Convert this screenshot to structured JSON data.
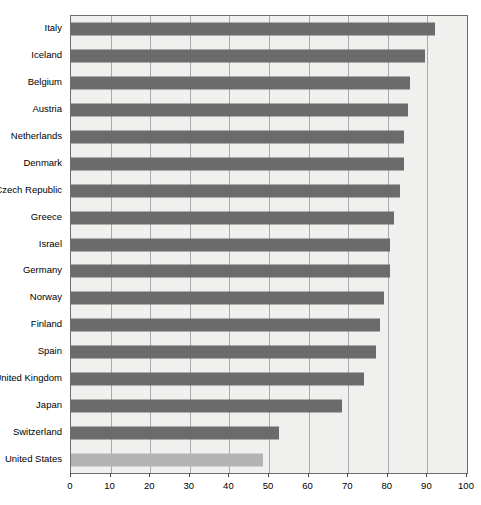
{
  "chart_data": {
    "type": "bar",
    "orientation": "horizontal",
    "title": "",
    "xlabel": "",
    "ylabel": "",
    "xlim": [
      0,
      100
    ],
    "xticks": [
      0,
      10,
      20,
      30,
      40,
      50,
      60,
      70,
      80,
      90,
      100
    ],
    "grid": true,
    "legend": "none",
    "bar_color": "#6b6b6b",
    "highlight_color": "#b3b3b3",
    "highlight_category": "United States",
    "plot_background": "#f0f0ef",
    "categories": [
      "Italy",
      "Iceland",
      "Belgium",
      "Austria",
      "Netherlands",
      "Denmark",
      "Czech Republic",
      "Greece",
      "Israel",
      "Germany",
      "Norway",
      "Finland",
      "Spain",
      "United Kingdom",
      "Japan",
      "Switzerland",
      "United States"
    ],
    "values": [
      92,
      89.5,
      85.5,
      85,
      84,
      84,
      83,
      81.5,
      80.5,
      80.5,
      79,
      78,
      77,
      74,
      68.5,
      52.5,
      48.5
    ]
  }
}
